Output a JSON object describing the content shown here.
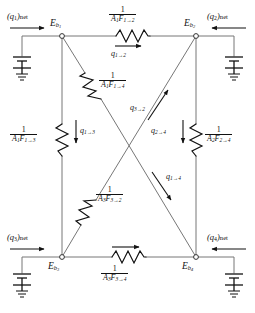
{
  "diagram": {
    "type": "electrical-network-schematic",
    "line_color": "#555555",
    "text_color": "#111111",
    "resistor_color": "#111111",
    "background": "#ffffff"
  },
  "nodes": [
    {
      "id": "Eb1",
      "label_base": "E",
      "label_sub": "b",
      "label_sub2": "1",
      "x": 62,
      "y": 36,
      "label_x": 52,
      "label_y": 22
    },
    {
      "id": "Eb2",
      "label_base": "E",
      "label_sub": "b",
      "label_sub2": "2",
      "x": 196,
      "y": 36,
      "label_x": 186,
      "label_y": 22
    },
    {
      "id": "Eb3",
      "label_base": "E",
      "label_sub": "b",
      "label_sub2": "3",
      "x": 62,
      "y": 257,
      "label_x": 50,
      "label_y": 262
    },
    {
      "id": "Eb4",
      "label_base": "E",
      "label_sub": "b",
      "label_sub2": "4",
      "x": 196,
      "y": 257,
      "label_x": 184,
      "label_y": 262
    }
  ],
  "sources": [
    {
      "id": "q1net",
      "label": "(q",
      "sub": "1",
      "suffix": ")net",
      "x": 8,
      "y": 14,
      "arrow": "right"
    },
    {
      "id": "q2net",
      "label": "(q",
      "sub": "2",
      "suffix": ")net",
      "x": 208,
      "y": 14,
      "arrow": "left"
    },
    {
      "id": "q3net",
      "label": "(q",
      "sub": "3",
      "suffix": ")net",
      "x": 8,
      "y": 232,
      "arrow": "right"
    },
    {
      "id": "q4net",
      "label": "(q",
      "sub": "4",
      "suffix": ")net",
      "x": 208,
      "y": 232,
      "arrow": "left"
    }
  ],
  "resistors": [
    {
      "id": "R12",
      "numerator": "1",
      "denom_base": "A",
      "denom_sub": "1",
      "denom_base2": "F",
      "denom_sub2": "1→2",
      "label_x": 108,
      "label_y": 7,
      "orientation": "horizontal"
    },
    {
      "id": "R14",
      "numerator": "1",
      "denom_base": "A",
      "denom_sub": "1",
      "denom_base2": "F",
      "denom_sub2": "1→4",
      "label_x": 100,
      "label_y": 74,
      "orientation": "diagonal"
    },
    {
      "id": "R13",
      "numerator": "1",
      "denom_base": "A",
      "denom_sub": "1",
      "denom_base2": "F",
      "denom_sub2": "1→3",
      "label_x": 12,
      "label_y": 128,
      "orientation": "vertical"
    },
    {
      "id": "R24",
      "numerator": "1",
      "denom_base": "A",
      "denom_sub": "2",
      "denom_base2": "F",
      "denom_sub2": "2→4",
      "label_x": 204,
      "label_y": 128,
      "orientation": "vertical"
    },
    {
      "id": "R32",
      "numerator": "1",
      "denom_base": "A",
      "denom_sub": "3",
      "denom_base2": "F",
      "denom_sub2": "3→2",
      "label_x": 97,
      "label_y": 188,
      "orientation": "diagonal"
    },
    {
      "id": "R34",
      "numerator": "1",
      "denom_base": "A",
      "denom_sub": "3",
      "denom_base2": "F",
      "denom_sub2": "3→4",
      "label_x": 103,
      "label_y": 268,
      "orientation": "horizontal"
    }
  ],
  "currents": [
    {
      "id": "q12",
      "base": "q",
      "sub": "1→2",
      "x": 110,
      "y": 52
    },
    {
      "id": "q32",
      "base": "q",
      "sub": "3→2",
      "x": 131,
      "y": 106
    },
    {
      "id": "q13",
      "base": "q",
      "sub": "1→3",
      "x": 76,
      "y": 128
    },
    {
      "id": "q24",
      "base": "q",
      "sub": "2→4",
      "x": 152,
      "y": 128
    },
    {
      "id": "q14",
      "base": "q",
      "sub": "1→4",
      "x": 165,
      "y": 176
    }
  ],
  "ground_symbols": [
    {
      "id": "gnd1",
      "x": 22,
      "y": 58
    },
    {
      "id": "gnd2",
      "x": 234,
      "y": 58
    },
    {
      "id": "gnd3",
      "x": 22,
      "y": 275
    },
    {
      "id": "gnd4",
      "x": 234,
      "y": 275
    }
  ]
}
